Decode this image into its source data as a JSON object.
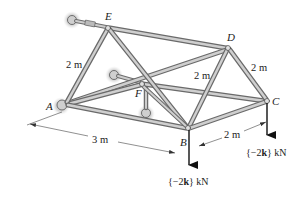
{
  "figure": {
    "type": "space-truss",
    "joints": {
      "A": {
        "label": "A",
        "x": 66,
        "y": 104
      },
      "B": {
        "label": "B",
        "x": 188,
        "y": 129
      },
      "C": {
        "label": "C",
        "x": 267,
        "y": 101
      },
      "D": {
        "label": "D",
        "x": 228,
        "y": 48
      },
      "E": {
        "label": "E",
        "x": 108,
        "y": 28
      },
      "F": {
        "label": "F",
        "x": 141,
        "y": 84
      }
    },
    "members": [
      [
        "A",
        "E"
      ],
      [
        "A",
        "B"
      ],
      [
        "A",
        "D"
      ],
      [
        "A",
        "F"
      ],
      [
        "E",
        "D"
      ],
      [
        "E",
        "B"
      ],
      [
        "E",
        "F"
      ],
      [
        "F",
        "C"
      ],
      [
        "D",
        "B"
      ],
      [
        "D",
        "C"
      ],
      [
        "B",
        "C"
      ],
      [
        "F",
        "B"
      ]
    ],
    "supports": [
      {
        "name": "support-E",
        "joint": "E",
        "ball_x": 72,
        "ball_y": 20
      },
      {
        "name": "support-F-horizontal",
        "joint": "F",
        "ball_x": 114,
        "ball_y": 75
      },
      {
        "name": "support-F-vertical",
        "joint": "F",
        "ball_x": 146,
        "ball_y": 113
      },
      {
        "name": "support-A",
        "joint": "A",
        "ball_x": 61,
        "ball_y": 106
      }
    ],
    "dimensions": {
      "AE": "2 m",
      "BD": "2 m",
      "DC": "2 m",
      "AB": "3 m",
      "BC": "2 m"
    },
    "loads": {
      "B": "{−2k} kN",
      "C": "{−2k} kN"
    },
    "load_parts": {
      "B": {
        "pre": "{−2",
        "bold": "k",
        "post": "} kN"
      },
      "C": {
        "pre": "{−2",
        "bold": "k",
        "post": "} kN"
      }
    }
  }
}
